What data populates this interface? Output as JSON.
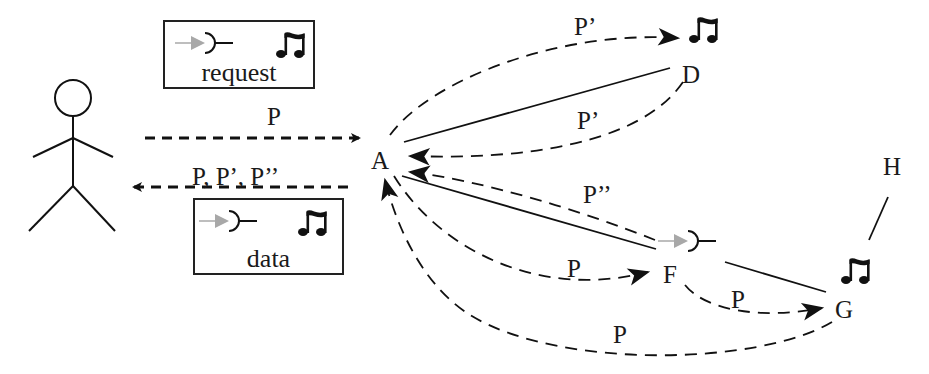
{
  "diagram": {
    "type": "peer-to-peer request/data flow",
    "actor": {
      "label": "user",
      "icon": "stick-figure-icon"
    },
    "legend": {
      "request": {
        "label": "request",
        "icons": [
          "gray-arrow-icon",
          "interface-socket-icon",
          "music-note-icon"
        ]
      },
      "data": {
        "label": "data",
        "icons": [
          "gray-arrow-icon",
          "interface-socket-icon",
          "music-note-icon"
        ]
      }
    },
    "nodes": {
      "A": {
        "label": "A"
      },
      "D": {
        "label": "D",
        "icon": "music-note-icon"
      },
      "F": {
        "label": "F",
        "icon": "interface-socket-icon"
      },
      "G": {
        "label": "G",
        "icon": "music-note-icon"
      },
      "H": {
        "label": "H"
      }
    },
    "edges": {
      "user_to_A": {
        "label": "P"
      },
      "A_to_user": {
        "label": "P, P’, P’’"
      },
      "A_to_D": {
        "label": "P’"
      },
      "D_to_A": {
        "label": "P’"
      },
      "F_to_A": {
        "label": "P’’"
      },
      "A_to_F": {
        "label": "P"
      },
      "F_to_G": {
        "label": "P"
      },
      "G_to_A": {
        "label": "P"
      }
    },
    "links": [
      [
        "A",
        "D"
      ],
      [
        "A",
        "F"
      ],
      [
        "F",
        "G"
      ],
      [
        "G",
        "H"
      ]
    ],
    "colors": {
      "line": "#1a1a1a",
      "gray_arrow": "#a8a8a8",
      "background": "#ffffff"
    }
  }
}
